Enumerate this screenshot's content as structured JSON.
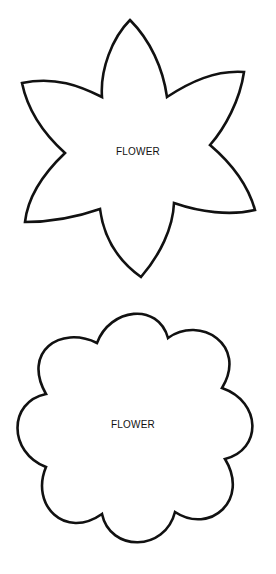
{
  "shapes": [
    {
      "id": "six-petal-flower",
      "label": "FLOWER",
      "petals": 6,
      "style": "pointed",
      "stroke": "#111111"
    },
    {
      "id": "scalloped-flower",
      "label": "FLOWER",
      "petals": 8,
      "style": "rounded",
      "stroke": "#111111"
    }
  ]
}
